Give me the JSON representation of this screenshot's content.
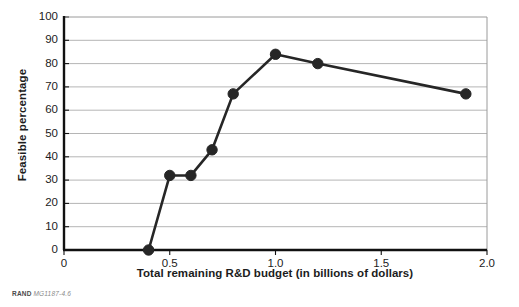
{
  "chart_data": {
    "type": "line",
    "title": "",
    "xlabel": "Total remaining R&D budget (in billions of dollars)",
    "ylabel": "Feasible percentage",
    "xlim": [
      0,
      2.0
    ],
    "ylim": [
      0,
      100
    ],
    "xticks": [
      0,
      0.5,
      1.0,
      1.5,
      2.0
    ],
    "xticklabels": [
      "0",
      "0.5",
      "1.0",
      "1.5",
      "2.0"
    ],
    "yticks": [
      0,
      10,
      20,
      30,
      40,
      50,
      60,
      70,
      80,
      90,
      100
    ],
    "yticklabels": [
      "0",
      "10",
      "20",
      "30",
      "40",
      "50",
      "60",
      "70",
      "80",
      "90",
      "100"
    ],
    "grid": "horizontal",
    "legend": "none",
    "series": [
      {
        "name": "Feasible percentage",
        "color": "#262626",
        "marker": "circle",
        "x": [
          0.4,
          0.5,
          0.6,
          0.7,
          0.8,
          1.0,
          1.2,
          1.9
        ],
        "values": [
          0,
          32,
          32,
          43,
          67,
          84,
          80,
          67
        ]
      }
    ]
  },
  "source": {
    "brand": "RAND",
    "document_number": "MG1187-4.6"
  },
  "style": {
    "line_color": "#262626",
    "marker_color": "#262626",
    "grid_color": "#b5b5b5",
    "axis_color": "#111111",
    "frame_color": "#9a9a9a",
    "text_color": "#1c1c1c",
    "background": "#ffffff"
  }
}
